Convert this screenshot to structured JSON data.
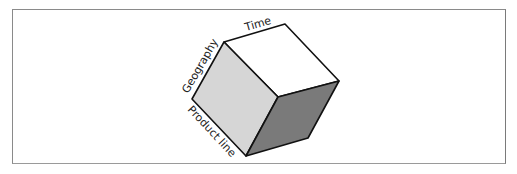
{
  "figure": {
    "type": "data-cube",
    "labels": {
      "top_edge": "Time",
      "left_edge": "Geography",
      "bottom_left_edge": "Product line"
    },
    "colors": {
      "top_face": "#ffffff",
      "left_face": "#d6d6d6",
      "right_face": "#7a7a7a",
      "edge": "#111111",
      "frame": "#8a8a8a"
    }
  }
}
